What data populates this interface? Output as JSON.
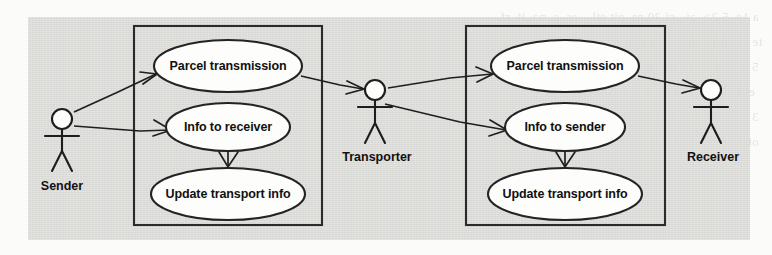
{
  "diagram": {
    "background_color": "#d9d9d6",
    "page_color": "#fbfbf9",
    "stroke_color": "#1f1f1f",
    "usecase_fill": "#fdfdfb"
  },
  "actors": [
    {
      "id": "sender",
      "label": "Sender",
      "x": 62,
      "y": 118
    },
    {
      "id": "transporter",
      "label": "Transporter",
      "x": 375,
      "y": 90
    },
    {
      "id": "receiver",
      "label": "Receiver",
      "x": 711,
      "y": 90
    }
  ],
  "systems": [
    {
      "id": "left-system",
      "x": 134,
      "y": 26,
      "width": 188,
      "height": 199,
      "use_cases": [
        {
          "id": "uc-parcel-transmission-left",
          "label": "Parcel transmission",
          "cx": 228,
          "cy": 66,
          "rx": 74,
          "ry": 26
        },
        {
          "id": "uc-info-to-receiver",
          "label": "Info to receiver",
          "cx": 228,
          "cy": 127,
          "rx": 62,
          "ry": 24
        },
        {
          "id": "uc-update-transport-info-left",
          "label": "Update transport info",
          "cx": 228,
          "cy": 194,
          "rx": 77,
          "ry": 26
        }
      ]
    },
    {
      "id": "right-system",
      "x": 466,
      "y": 26,
      "width": 199,
      "height": 199,
      "use_cases": [
        {
          "id": "uc-parcel-transmission-right",
          "label": "Parcel transmission",
          "cx": 565,
          "cy": 66,
          "rx": 74,
          "ry": 26
        },
        {
          "id": "uc-info-to-sender",
          "label": "Info to sender",
          "cx": 565,
          "cy": 127,
          "rx": 60,
          "ry": 24
        },
        {
          "id": "uc-update-transport-info-right",
          "label": "Update transport info",
          "cx": 565,
          "cy": 194,
          "rx": 77,
          "ry": 26
        }
      ]
    }
  ],
  "associations": [
    {
      "id": "assoc-sender-parcel",
      "from": "sender",
      "to": "uc-parcel-transmission-left",
      "arrow": "open"
    },
    {
      "id": "assoc-sender-info",
      "from": "sender",
      "to": "uc-info-to-receiver",
      "arrow": "open"
    },
    {
      "id": "assoc-parcel-transporter",
      "from": "uc-parcel-transmission-left",
      "to": "transporter",
      "arrow": "open"
    },
    {
      "id": "assoc-transporter-parcel",
      "from": "transporter",
      "to": "uc-parcel-transmission-right",
      "arrow": "open"
    },
    {
      "id": "assoc-transporter-info",
      "from": "transporter",
      "to": "uc-info-to-sender",
      "arrow": "open"
    },
    {
      "id": "assoc-parcel-receiver",
      "from": "uc-parcel-transmission-right",
      "to": "receiver",
      "arrow": "open"
    }
  ],
  "dependencies": [
    {
      "id": "dep-info-receiver-update",
      "from": "uc-info-to-receiver",
      "to": "uc-update-transport-info-left",
      "arrow": "open-v"
    },
    {
      "id": "dep-info-sender-update",
      "from": "uc-info-to-sender",
      "to": "uc-update-transport-info-right",
      "arrow": "open-v"
    }
  ],
  "bleed_text": "  a 1e  5 2>  ai   ci 20 nr  oit etl    es  s  na  it  rf\n te ai  oitt a ot e  c 2s ei o  n  ar  s  n  ni  rt e  1\n  5 rr  n 3 2   ts  mi  ar  nf  i  2 >  n  c  1e  3  i\n   ei la  it  c 2  ni  rt  s 5 > nr  oi  sa  e  t  n\n  3 e   n 1e  > li  c 3  ni  rt  es  ia  o  n  2  it\n  ot a  tr  ni  5  2 e  rs  ti  o  n  1 e  r  s  e"
}
